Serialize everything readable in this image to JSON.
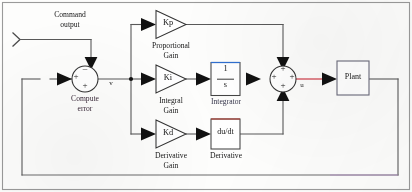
{
  "diagram": {
    "frame_color": "#8a8a8a",
    "wire_color": "#595959",
    "blocks": {
      "input_port": {
        "label": "",
        "icon": "input-chevron-icon"
      },
      "command": {
        "line1": "Command",
        "line2": "output"
      },
      "sum_error": {
        "caption_line1": "Compute",
        "caption_line2": "error",
        "signs": {
          "top": "–",
          "left": "+",
          "bottom": "+"
        }
      },
      "kp": {
        "symbol": "Kp",
        "caption_line1": "Proportional",
        "caption_line2": "Gain"
      },
      "ki": {
        "symbol": "Ki",
        "caption_line1": "Integral",
        "caption_line2": "Gain"
      },
      "kd": {
        "symbol": "Kd",
        "caption_line1": "Derivative",
        "caption_line2": "Gain"
      },
      "integrator": {
        "numerator": "1",
        "denominator": "s",
        "caption": "Integrator",
        "top_border_color": "#2f6fd0"
      },
      "derivative": {
        "symbol": "du/dt",
        "caption": "Derivative",
        "top_border_color": "#b0443a"
      },
      "sum_u": {
        "signs": {
          "top": "+",
          "left": "+",
          "bottom": "+",
          "right": "+"
        }
      },
      "plant": {
        "label": "Plant"
      }
    },
    "signals": {
      "error": "v",
      "control": "u"
    },
    "wire_highlights": {
      "integrator_out": "#2eaa4a",
      "u_line": "#d03a45",
      "feedback_tail": "#b48ec8"
    }
  }
}
